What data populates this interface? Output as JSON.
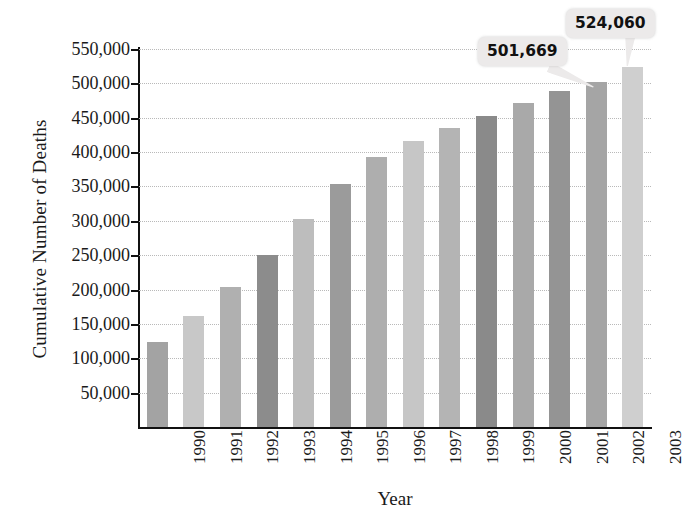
{
  "chart_data": {
    "type": "bar",
    "title": "",
    "xlabel": "Year",
    "ylabel": "Cumulative Number of Deaths",
    "categories": [
      "1990",
      "1991",
      "1992",
      "1993",
      "1994",
      "1995",
      "1996",
      "1997",
      "1998",
      "1999",
      "2000",
      "2001",
      "2002",
      "2003"
    ],
    "values": [
      124000,
      161000,
      204000,
      250000,
      302000,
      354000,
      393000,
      416000,
      435000,
      452000,
      471000,
      489000,
      501669,
      524060
    ],
    "ylim": [
      0,
      550000
    ],
    "ytick_labels": [
      "550,000",
      "500,000",
      "450,000",
      "400,000",
      "350,000",
      "300,000",
      "250,000",
      "200,000",
      "150,000",
      "100,000",
      "50,000"
    ],
    "ytick_values": [
      550000,
      500000,
      450000,
      400000,
      350000,
      300000,
      250000,
      200000,
      150000,
      100000,
      50000
    ],
    "grid": true,
    "legend": "none",
    "bar_colors": [
      "#a3a3a3",
      "#c8c8c8",
      "#b0b0b0",
      "#8c8c8c",
      "#bdbdbd",
      "#9b9b9b",
      "#aeaeae",
      "#c6c6c6",
      "#b4b4b4",
      "#8a8a8a",
      "#a9a9a9",
      "#949494",
      "#a5a5a5",
      "#cfcfcf"
    ],
    "annotations": [
      {
        "label": "501,669",
        "category": "2002",
        "value": 501669
      },
      {
        "label": "524,060",
        "category": "2003",
        "value": 524060
      }
    ]
  },
  "axes": {
    "y_title": "Cumulative Number of Deaths",
    "x_title": "Year"
  }
}
